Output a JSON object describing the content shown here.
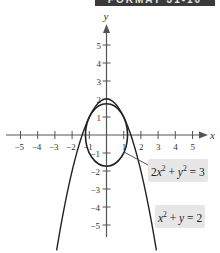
{
  "banner": {
    "text": "FORMAT 31-10"
  },
  "chart_data": {
    "type": "line",
    "title": "",
    "xlabel": "x",
    "ylabel": "y",
    "xlim": [
      -5.5,
      5.8
    ],
    "ylim": [
      -6,
      6
    ],
    "grid": false,
    "x_ticks": [
      -5,
      -4,
      -3,
      -2,
      -1,
      1,
      2,
      3,
      4,
      5
    ],
    "y_ticks": [
      -5,
      -4,
      -3,
      -2,
      -1,
      1,
      2,
      3,
      4,
      5
    ],
    "series": [
      {
        "name": "2x^2 + y^2 = 3",
        "kind": "ellipse",
        "semi_axis_x": 1.2247,
        "semi_axis_y": 1.7321,
        "label": "2x² + y² = 3"
      },
      {
        "name": "x^2 + y = 2",
        "kind": "parabola",
        "equation": "y = 2 - x^2",
        "vertex": [
          0,
          2
        ],
        "label": "x² + y = 2"
      }
    ],
    "annotations": [
      {
        "text": "2x² + y² = 3",
        "position": "right of ellipse, below x-axis"
      },
      {
        "text": "x² + y = 2",
        "position": "lower right"
      }
    ]
  },
  "labels": {
    "ellipse": {
      "a": "2",
      "b": "x",
      "c": "2",
      "d": " + ",
      "e": "y",
      "f": "2",
      "g": " = 3"
    },
    "parabola": {
      "a": "x",
      "b": "2",
      "c": " + ",
      "d": "y",
      "e": " = 2"
    }
  }
}
